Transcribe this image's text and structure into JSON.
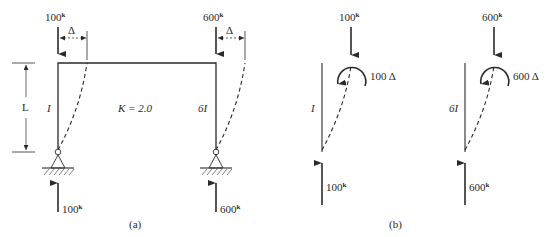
{
  "figure": {
    "panel_a": {
      "caption": "(a)",
      "left_column": {
        "top_load": "100",
        "reaction": "100",
        "unit": "k",
        "inertia": "I",
        "drift_label": "Δ"
      },
      "right_column": {
        "top_load": "600",
        "reaction": "600",
        "unit": "k",
        "inertia": "6I",
        "drift_label": "Δ"
      },
      "height_label": "L",
      "stiffness_label": "K = 2.0"
    },
    "panel_b": {
      "caption": "(b)",
      "column_1": {
        "top_load": "100",
        "reaction": "100",
        "unit": "k",
        "inertia": "I",
        "moment_label": "100 Δ"
      },
      "column_2": {
        "top_load": "600",
        "reaction": "600",
        "unit": "k",
        "inertia": "6I",
        "moment_label": "600 Δ"
      }
    },
    "colors": {
      "line": "#2a2a2a",
      "background": "#ffffff"
    }
  }
}
